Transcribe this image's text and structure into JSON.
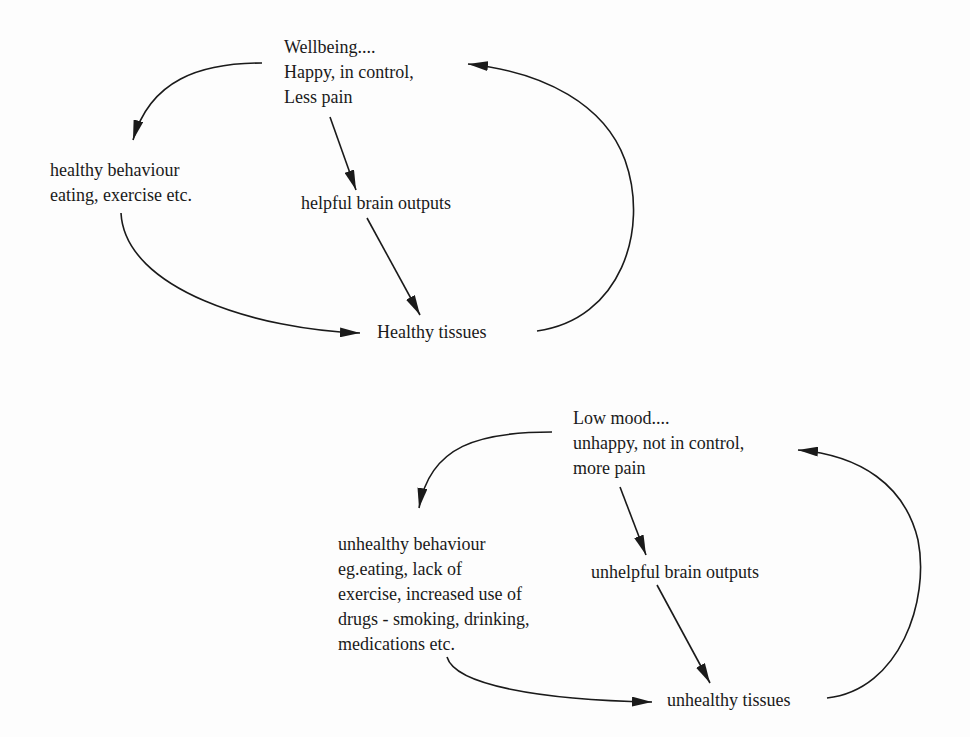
{
  "diagrams": [
    {
      "name": "wellbeing-cycle",
      "state": {
        "lines": [
          "Wellbeing....",
          "Happy, in control,",
          "Less pain"
        ]
      },
      "behaviour": {
        "lines": [
          "healthy behaviour",
          "eating, exercise etc."
        ]
      },
      "brain": {
        "label": "helpful brain outputs"
      },
      "tissues": {
        "label": "Healthy tissues"
      }
    },
    {
      "name": "low-mood-cycle",
      "state": {
        "lines": [
          "Low mood....",
          "unhappy, not in control,",
          "more pain"
        ]
      },
      "behaviour": {
        "lines": [
          "unhealthy behaviour",
          "eg.eating, lack of",
          "exercise, increased use of",
          "drugs - smoking, drinking,",
          "medications etc."
        ]
      },
      "brain": {
        "label": "unhelpful brain outputs"
      },
      "tissues": {
        "label": "unhealthy tissues"
      }
    }
  ],
  "colors": {
    "ink": "#1a1a1a",
    "paper": "#fdfdfd"
  }
}
